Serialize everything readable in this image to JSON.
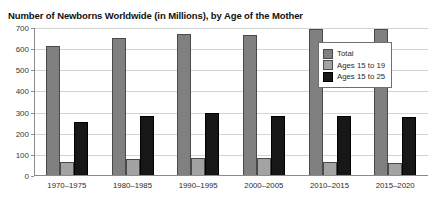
{
  "chart_data": {
    "type": "bar",
    "title": "Number of Newborns Worldwide (in Millions), by Age of the Mother",
    "xlabel": "",
    "ylabel": "",
    "ylim": [
      0,
      700
    ],
    "yticks": [
      0,
      100,
      200,
      300,
      400,
      500,
      600,
      700
    ],
    "grid": true,
    "legend_position": "upper-right-inside",
    "categories": [
      "1970–1975",
      "1980–1985",
      "1990–1995",
      "2000–2005",
      "2010–2015",
      "2015–2020"
    ],
    "series": [
      {
        "name": "Total",
        "color": "#808080",
        "values": [
          615,
          653,
          672,
          668,
          695,
          697
        ]
      },
      {
        "name": "Ages 15 to 19",
        "color": "#a3a3a3",
        "values": [
          65,
          80,
          86,
          85,
          68,
          62
        ]
      },
      {
        "name": "Ages 15 to 25",
        "color": "#171717",
        "values": [
          255,
          286,
          300,
          285,
          283,
          278
        ]
      }
    ]
  }
}
